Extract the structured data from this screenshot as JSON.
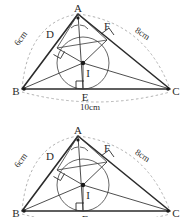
{
  "figure": {
    "vertices": [
      {
        "id": "A",
        "label": "A",
        "x": 78,
        "y": 14
      },
      {
        "id": "B",
        "label": "B",
        "x": 22,
        "y": 89
      },
      {
        "id": "C",
        "label": "C",
        "x": 170,
        "y": 89
      },
      {
        "id": "D",
        "label": "D",
        "x": 53,
        "y": 38
      },
      {
        "id": "E",
        "label": "E",
        "x": 89,
        "y": 92
      },
      {
        "id": "F",
        "label": "F",
        "x": 105,
        "y": 33
      },
      {
        "id": "I",
        "label": "I",
        "x": 84,
        "y": 68
      }
    ],
    "side_labels": [
      {
        "id": "AB",
        "text": "6cm",
        "x": 23,
        "y": 38
      },
      {
        "id": "AC",
        "text": "8cm",
        "x": 140,
        "y": 36
      },
      {
        "id": "BC",
        "text": "10cm",
        "x": 90,
        "y": 107
      }
    ],
    "incircle": {
      "cx": 83,
      "cy": 63,
      "r": 26
    },
    "incenter": {
      "cx": 83,
      "cy": 63
    },
    "colors": {
      "stroke": "#2b2b2b",
      "thin_stroke": "#4a4a4a",
      "dashed_arc": "#9a9a9a",
      "text": "#2b2b2b",
      "background": "#ffffff"
    },
    "marks": {
      "right_angle_D": "right-angle-mark",
      "right_angle_E": "right-angle-mark",
      "right_angle_F": "right-angle-mark",
      "angle_bisector_A": "angle-arc-mark"
    }
  },
  "figures": [
    {
      "id": "figure-top",
      "clipped": false
    },
    {
      "id": "figure-bottom",
      "clipped": true
    }
  ]
}
